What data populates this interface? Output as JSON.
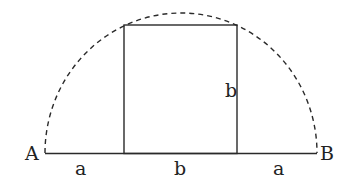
{
  "diagram": {
    "points": {
      "left": "A",
      "right": "B"
    },
    "segments": {
      "left_label": "a",
      "middle_label": "b",
      "right_label": "a"
    },
    "square_side_label": "b",
    "colors": {
      "stroke": "#2a2a2a",
      "background": "#ffffff"
    }
  }
}
